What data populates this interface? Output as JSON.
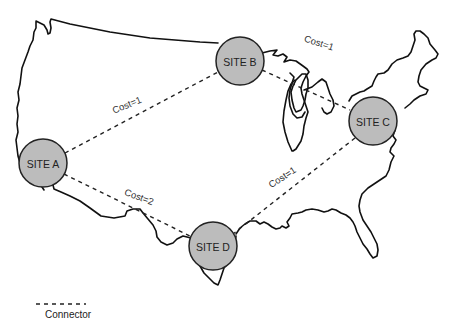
{
  "diagram": {
    "type": "network-map",
    "background": "#ffffff",
    "colors": {
      "site_fill": "#bcbcbc",
      "site_stroke": "#222222",
      "connector": "#222222",
      "map_outline": "#111111"
    },
    "sites": [
      {
        "id": "A",
        "label": "SITE A",
        "cx": 43,
        "cy": 163,
        "r": 24
      },
      {
        "id": "B",
        "label": "SITE B",
        "cx": 240,
        "cy": 61,
        "r": 24
      },
      {
        "id": "C",
        "label": "SITE C",
        "cx": 373,
        "cy": 121,
        "r": 24
      },
      {
        "id": "D",
        "label": "SITE D",
        "cx": 213,
        "cy": 246,
        "r": 24
      }
    ],
    "connectors": [
      {
        "from": "A",
        "to": "B",
        "cost_label": "Cost=1",
        "label_x": 128,
        "label_y": 108,
        "label_rot": -22
      },
      {
        "from": "B",
        "to": "C",
        "cost_label": "Cost=1",
        "label_x": 318,
        "label_y": 46,
        "label_rot": 18
      },
      {
        "from": "A",
        "to": "D",
        "cost_label": "Cost=2",
        "label_x": 138,
        "label_y": 200,
        "label_rot": 20
      },
      {
        "from": "C",
        "to": "D",
        "cost_label": "Cost=1",
        "label_x": 284,
        "label_y": 180,
        "label_rot": -33
      }
    ],
    "legend": {
      "connector_label": "Connector"
    }
  }
}
